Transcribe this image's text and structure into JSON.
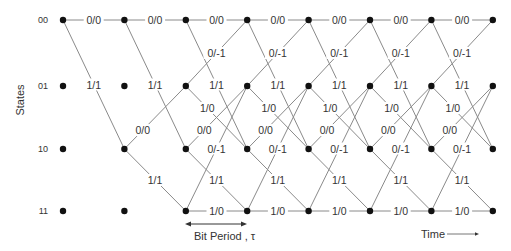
{
  "diagram": {
    "type": "trellis",
    "y_axis_title": "States",
    "states": [
      "00",
      "01",
      "10",
      "11"
    ],
    "time_steps": 8,
    "colors": {
      "edge": "#8a8a8a",
      "node": "#111111",
      "text": "#333333"
    },
    "transition_types": [
      {
        "from": "00",
        "to": "00",
        "label": "0/0"
      },
      {
        "from": "00",
        "to": "10",
        "label": "1/1"
      },
      {
        "from": "01",
        "to": "00",
        "label": "0/-1"
      },
      {
        "from": "01",
        "to": "10",
        "label": "1/0"
      },
      {
        "from": "10",
        "to": "01",
        "label": "0/0"
      },
      {
        "from": "10",
        "to": "11",
        "label": "1/1"
      },
      {
        "from": "11",
        "to": "01",
        "label": "0/-1"
      },
      {
        "from": "11",
        "to": "11",
        "label": "1/0"
      }
    ],
    "stages": [
      {
        "from_step": 0,
        "active_from_states": [
          "00"
        ]
      },
      {
        "from_step": 1,
        "active_from_states": [
          "00",
          "10"
        ]
      },
      {
        "from_step": 2,
        "active_from_states": [
          "00",
          "01",
          "10",
          "11"
        ]
      },
      {
        "from_step": 3,
        "active_from_states": [
          "00",
          "01",
          "10",
          "11"
        ]
      },
      {
        "from_step": 4,
        "active_from_states": [
          "00",
          "01",
          "10",
          "11"
        ]
      },
      {
        "from_step": 5,
        "active_from_states": [
          "00",
          "01",
          "10",
          "11"
        ]
      },
      {
        "from_step": 6,
        "active_from_states": [
          "00",
          "01",
          "10",
          "11"
        ]
      }
    ],
    "annotations": {
      "bit_period": "Bit Period , τ",
      "time": "Time"
    }
  }
}
